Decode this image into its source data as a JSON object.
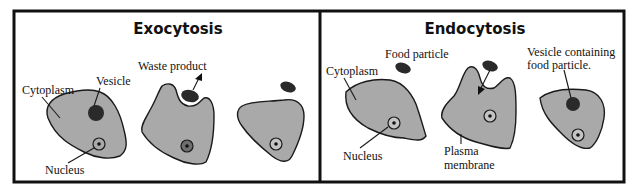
{
  "panels": [
    {
      "title": "Exocytosis",
      "labels": {
        "cytoplasm": "Cytoplasm",
        "vesicle": "Vesicle",
        "nucleus": "Nucleus",
        "waste": "Waste product"
      }
    },
    {
      "title": "Endocytosis",
      "labels": {
        "cytoplasm": "Cytoplasm",
        "food": "Food particle",
        "nucleus": "Nucleus",
        "plasma_line1": "Plasma",
        "plasma_line2": "membrane",
        "vesicle_line1": "Vesicle containing",
        "vesicle_line2": "food particle."
      }
    }
  ],
  "colors": {
    "cell_fill": "#a9a9a9",
    "outline": "#1a1a1a",
    "vesicle": "#2a2a2a",
    "background": "#ffffff"
  }
}
